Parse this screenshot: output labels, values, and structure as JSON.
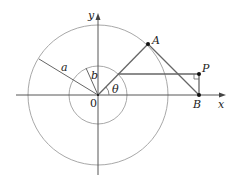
{
  "diagram": {
    "labels": {
      "y_axis": "y",
      "x_axis": "x",
      "origin": "0",
      "point_A": "A",
      "point_P": "P",
      "point_B": "B",
      "radius_large": "a",
      "radius_small": "b",
      "angle": "θ"
    },
    "colors": {
      "circle": "#a8a8a8",
      "axis": "#444444",
      "linkage": "#666666",
      "point": "#111111"
    }
  }
}
